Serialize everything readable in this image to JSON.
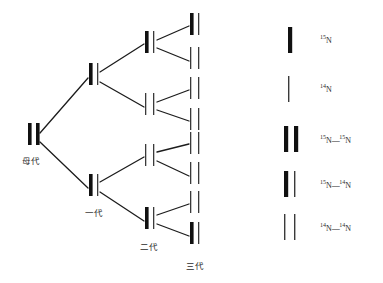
{
  "figure": {
    "colors": {
      "strand_heavy": "#111111",
      "strand_light": "#3a3a3a",
      "connector": "#1c1c1c",
      "background": "#ffffff",
      "text": "#2b2b2b"
    }
  },
  "generations": [
    {
      "id": "parent",
      "label": "母代",
      "label_x": 22,
      "label_y": 160,
      "nodes": [
        {
          "x": 28,
          "y": 134,
          "left": "heavy",
          "right": "heavy",
          "type": "15N-15N"
        }
      ]
    },
    {
      "id": "gen1",
      "label": "一代",
      "label_x": 85,
      "label_y": 208,
      "nodes": [
        {
          "x": 89,
          "y": 74,
          "left": "heavy",
          "right": "light",
          "type": "15N-14N"
        },
        {
          "x": 89,
          "y": 185,
          "left": "heavy",
          "right": "light",
          "type": "15N-14N"
        }
      ]
    },
    {
      "id": "gen2",
      "label": "二代",
      "label_x": 142,
      "label_y": 243,
      "nodes": [
        {
          "x": 145,
          "y": 42,
          "left": "heavy",
          "right": "light",
          "type": "15N-14N"
        },
        {
          "x": 145,
          "y": 104,
          "left": "light",
          "right": "light",
          "type": "14N-14N"
        },
        {
          "x": 145,
          "y": 155,
          "left": "light",
          "right": "light",
          "type": "14N-14N"
        },
        {
          "x": 145,
          "y": 218,
          "left": "heavy",
          "right": "light",
          "type": "15N-14N"
        }
      ]
    },
    {
      "id": "gen3",
      "label": "三代",
      "label_x": 188,
      "label_y": 262,
      "nodes": [
        {
          "x": 190,
          "y": 24,
          "left": "heavy",
          "right": "light",
          "type": "15N-14N"
        },
        {
          "x": 190,
          "y": 58,
          "left": "light",
          "right": "light",
          "type": "14N-14N"
        },
        {
          "x": 190,
          "y": 88,
          "left": "light",
          "right": "light",
          "type": "14N-14N"
        },
        {
          "x": 190,
          "y": 119,
          "left": "light",
          "right": "light",
          "type": "14N-14N"
        },
        {
          "x": 190,
          "y": 143,
          "left": "light",
          "right": "light",
          "type": "14N-14N"
        },
        {
          "x": 190,
          "y": 173,
          "left": "light",
          "right": "light",
          "type": "14N-14N"
        },
        {
          "x": 190,
          "y": 202,
          "left": "light",
          "right": "light",
          "type": "14N-14N"
        },
        {
          "x": 190,
          "y": 233,
          "left": "heavy",
          "right": "light",
          "type": "15N-14N"
        }
      ]
    }
  ],
  "legend": {
    "items": [
      {
        "id": "single-heavy",
        "pattern": "heavy",
        "mass": "15",
        "element": "N",
        "text": "15N",
        "bar_x": 288,
        "bar_y": 40,
        "label_x": 320,
        "label_y": 42
      },
      {
        "id": "single-light",
        "pattern": "light",
        "mass": "14",
        "element": "N",
        "text": "14N",
        "bar_x": 288,
        "bar_y": 89,
        "label_x": 320,
        "label_y": 91
      },
      {
        "id": "pair-heavy-heavy",
        "pattern": "heavy-heavy",
        "left_mass": "15",
        "right_mass": "14",
        "text": "15N—15N",
        "bar_x": 284,
        "bar_y": 139,
        "label_x": 320,
        "label_y": 142
      },
      {
        "id": "pair-heavy-light",
        "pattern": "heavy-light",
        "left_mass": "15",
        "right_mass": "14",
        "text": "15N—14N",
        "bar_x": 284,
        "bar_y": 184,
        "label_x": 320,
        "label_y": 187
      },
      {
        "id": "pair-light-light",
        "pattern": "light-light",
        "left_mass": "14",
        "right_mass": "14",
        "text": "14N—14N",
        "bar_x": 284,
        "bar_y": 227,
        "label_x": 320,
        "label_y": 230
      }
    ],
    "entries_text": {
      "e0_sup": "15",
      "e0_base": "N",
      "e1_sup": "14",
      "e1_base": "N",
      "e2_lsup": "15",
      "e2_lbase": "N",
      "e2_bond": "—",
      "e2_rsup": "15",
      "e2_rbase": "N",
      "e3_lsup": "15",
      "e3_lbase": "N",
      "e3_bond": "—",
      "e3_rsup": "14",
      "e3_rbase": "N",
      "e4_lsup": "14",
      "e4_lbase": "N",
      "e4_bond": "—",
      "e4_rsup": "14",
      "e4_rbase": "N"
    }
  },
  "labels": {
    "parent": "母代",
    "gen1": "一代",
    "gen2": "二代",
    "gen3": "三代"
  }
}
